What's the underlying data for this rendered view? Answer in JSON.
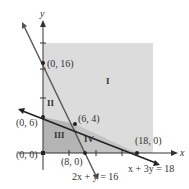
{
  "diagram": {
    "type": "linear-programming-feasible-regions",
    "axes": {
      "x_label": "x",
      "y_label": "y"
    },
    "colors": {
      "region_light": "#dcdcdc",
      "region_dark": "#b4b4b4",
      "line": "#222222",
      "line_steep": "#555555",
      "text": "#333333"
    },
    "points": [
      {
        "label": "(0, 16)",
        "x": 0,
        "y": 16
      },
      {
        "label": "(0, 6)",
        "x": 0,
        "y": 6
      },
      {
        "label": "(6, 4)",
        "x": 6,
        "y": 4
      },
      {
        "label": "(0, 0)",
        "x": 0,
        "y": 0
      },
      {
        "label": "(8, 0)",
        "x": 8,
        "y": 0
      },
      {
        "label": "(18, 0)",
        "x": 18,
        "y": 0
      }
    ],
    "regions": [
      {
        "label": "I"
      },
      {
        "label": "II"
      },
      {
        "label": "III"
      },
      {
        "label": "IV"
      }
    ],
    "lines": [
      {
        "equation": "2x + y = 16"
      },
      {
        "equation": "x + 3y = 18"
      }
    ]
  }
}
